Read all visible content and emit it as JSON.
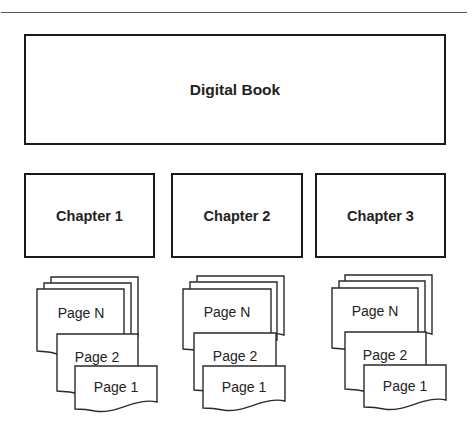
{
  "diagram": {
    "root": {
      "label": "Digital Book"
    },
    "chapters": [
      {
        "label": "Chapter 1",
        "pages": [
          "Page N",
          "Page 2",
          "Page 1"
        ]
      },
      {
        "label": "Chapter 2",
        "pages": [
          "Page N",
          "Page 2",
          "Page 1"
        ]
      },
      {
        "label": "Chapter 3",
        "pages": [
          "Page N",
          "Page 2",
          "Page 1"
        ]
      }
    ],
    "colors": {
      "stroke": "#1a1a1a",
      "text": "#222222",
      "background": "#ffffff"
    }
  }
}
